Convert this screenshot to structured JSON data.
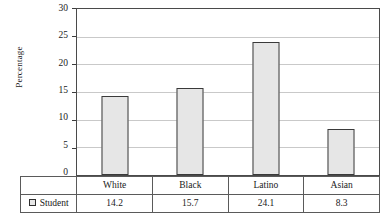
{
  "chart_data": {
    "type": "bar",
    "title": "",
    "xlabel": "",
    "ylabel": "Percentage",
    "categories": [
      "White",
      "Black",
      "Latino",
      "Asian"
    ],
    "series": [
      {
        "name": "Student",
        "values": [
          14.2,
          15.7,
          24.1,
          8.3
        ]
      }
    ],
    "values": [
      14.2,
      15.7,
      24.1,
      8.3
    ],
    "ylim": [
      0,
      30
    ],
    "yticks": [
      0,
      5,
      10,
      15,
      20,
      25,
      30
    ],
    "ytick_labels": [
      "0",
      "5",
      "10",
      "15",
      "20",
      "25",
      "30"
    ],
    "grid": true,
    "legend_position": "table-row-header",
    "bar_fill_color": "#e6e6e6",
    "bar_border_color": "#3a3a3a",
    "gridline_color": "#c9c9c9",
    "axis_color": "#4a4a4a"
  },
  "table": {
    "legend_label": "Student",
    "legend_marker": "square-outline-icon",
    "category_row": [
      "White",
      "Black",
      "Latino",
      "Asian"
    ],
    "value_row": [
      "14.2",
      "15.7",
      "24.1",
      "8.3"
    ]
  }
}
